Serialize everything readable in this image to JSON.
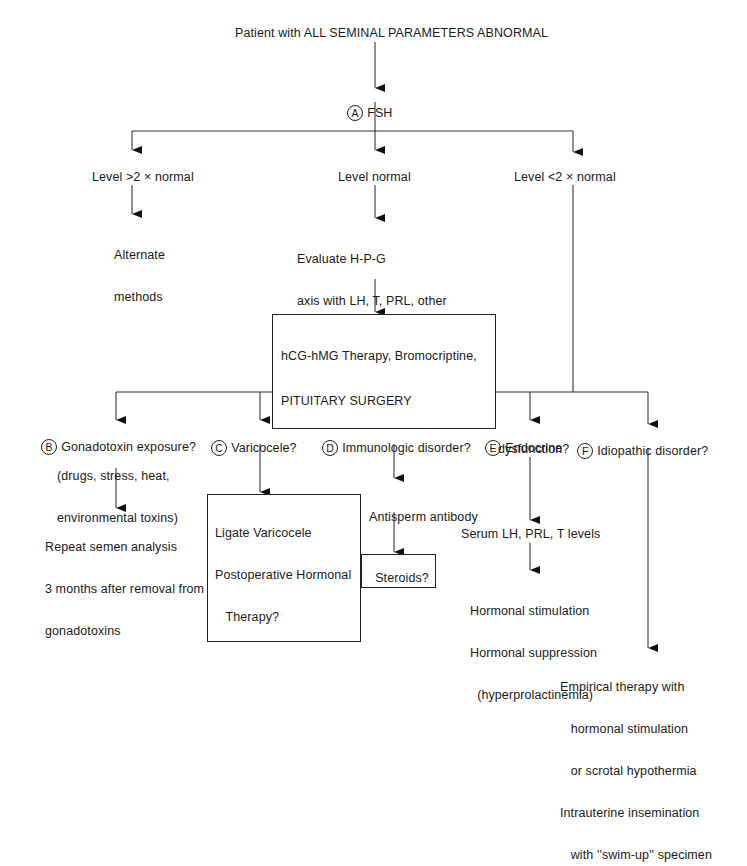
{
  "root": {
    "text": "Patient with ALL SEMINAL PARAMETERS ABNORMAL"
  },
  "fsh": {
    "marker": "A",
    "text": "FSH"
  },
  "branches_top": [
    {
      "label": "Level >2 × normal",
      "result": [
        "Alternate",
        "methods"
      ]
    },
    {
      "label": "Level normal",
      "result": [
        "Evaluate H-P-G",
        "axis with LH, T, PRL, other",
        "pituitary hormones; evaluation",
        "of sella turcica"
      ],
      "box": [
        "hCG-hMG Therapy, Bromocriptine,",
        "PITUITARY SURGERY"
      ]
    },
    {
      "label": "Level <2 × normal"
    }
  ],
  "branches_bottom": [
    {
      "marker": "B",
      "label": [
        "Gonadotoxin exposure?",
        "(drugs, stress, heat,",
        "environmental toxins)"
      ],
      "result": [
        "Repeat semen analysis",
        "3 months after removal from",
        "gonadotoxins"
      ]
    },
    {
      "marker": "C",
      "label": [
        "Varicocele?"
      ],
      "box": [
        "Ligate Varicocele",
        "Postoperative Hormonal",
        "   Therapy?"
      ]
    },
    {
      "marker": "D",
      "label": [
        "Immunologic disorder?"
      ],
      "result": [
        "Antisperm antibody",
        "testing"
      ],
      "box": [
        "Steroids?"
      ]
    },
    {
      "marker": "E",
      "label": [
        "Endocrine",
        "dysfunction?"
      ],
      "result": [
        "Serum LH, PRL, T levels"
      ],
      "result2": [
        "Hormonal stimulation",
        "Hormonal suppression",
        "  (hyperprolactinemia)"
      ]
    },
    {
      "marker": "F",
      "label": [
        "Idiopathic disorder?"
      ],
      "result": [
        "Empirical therapy with",
        "   hormonal stimulation",
        "   or scrotal hypothermia",
        "Intrauterine insemination",
        "   with ''swim-up'' specimen"
      ]
    }
  ]
}
